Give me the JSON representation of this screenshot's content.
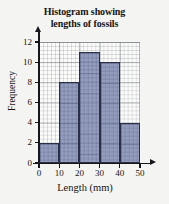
{
  "chart_data": {
    "type": "bar",
    "title": "Histogram showing lengths of fossils",
    "title_lines": [
      "Histogram showing",
      "lengths of fossils"
    ],
    "xlabel": "Length (mm)",
    "ylabel": "Frequency",
    "categories": [
      "0-10",
      "10-20",
      "20-30",
      "30-40",
      "40-50"
    ],
    "bin_edges": [
      0,
      10,
      20,
      30,
      40,
      50
    ],
    "values": [
      2,
      8,
      11,
      10,
      4
    ],
    "xlim": [
      0,
      50
    ],
    "ylim": [
      0,
      12
    ],
    "x_ticks": [
      "0",
      "10",
      "20",
      "30",
      "40",
      "50"
    ],
    "y_ticks": [
      "0",
      "2",
      "4",
      "6",
      "8",
      "10",
      "12"
    ],
    "x_tick_values": [
      0,
      10,
      20,
      30,
      40,
      50
    ],
    "y_tick_values": [
      0,
      2,
      4,
      6,
      8,
      10,
      12
    ],
    "grid": true,
    "grid_style": "squared graph paper, minor squares 1 unit",
    "legend": null,
    "legend_position": "none",
    "bar_fill_color": "#6e7aa6",
    "bar_edge_color": "#2a2f45",
    "background_color": "#f4f4f2",
    "axis_color": "#16161c",
    "axis_arrows": true
  }
}
